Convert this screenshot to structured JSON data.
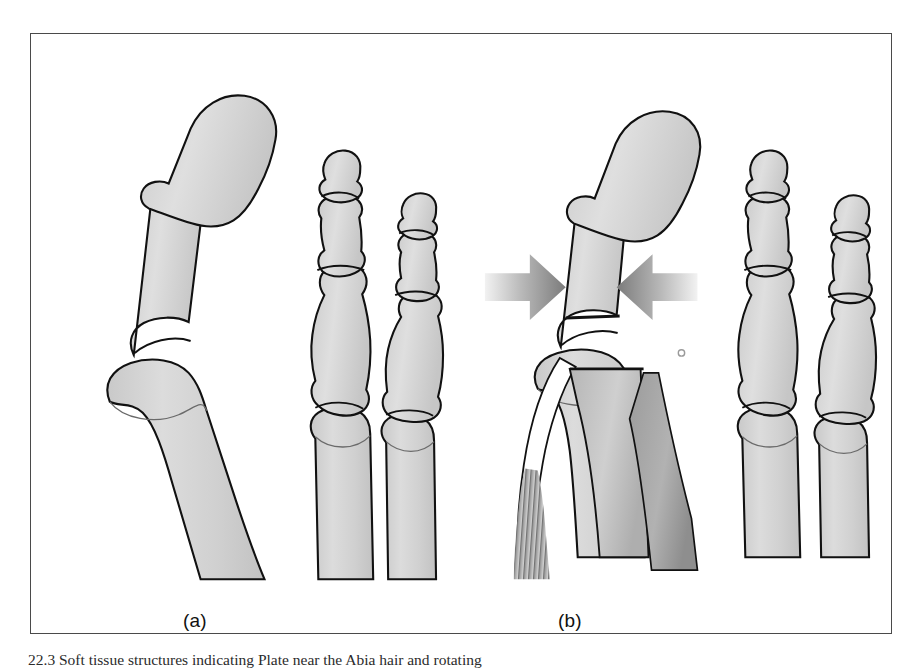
{
  "figure": {
    "caption": "22.3 Soft tissue structures indicating Plate  near the Abia hair and rotating",
    "frame_border_color": "#4a4a4a",
    "background_color": "#ffffff"
  },
  "panels": [
    {
      "id": "a",
      "label": "(a)",
      "description": "Normal alignment of the first, second and third toe phalanges with the first metatarsal head"
    },
    {
      "id": "b",
      "label": "(b)",
      "description": "Phalanges with opposing compression arrows at the proximal phalanx base and soft tissue, tendon and muscle structures at the first metatarsophalangeal joint"
    }
  ],
  "colors": {
    "bone_fill": "#d2d2d2",
    "bone_fill_light": "#dedede",
    "bone_outline": "#111111",
    "soft_tissue_dark": "#a8a8a8",
    "soft_tissue_mid": "#bdbdbd",
    "soft_tissue_light": "#e8e8e8",
    "muscle_stripe": "#777777",
    "arrow_dark": "#7d7d7d",
    "arrow_light": "#ededed",
    "frame": "#4a4a4a"
  },
  "annotations": {
    "arrow_left": {
      "name": "compression-arrow-left",
      "direction": "right",
      "meaning": "compressive force applied medially"
    },
    "arrow_right": {
      "name": "compression-arrow-right",
      "direction": "left",
      "meaning": "compressive force applied laterally"
    }
  },
  "anatomy": {
    "panel_a_bones": [
      "first distal phalanx",
      "first proximal phalanx",
      "first metatarsal",
      "second distal phalanx",
      "second middle phalanx",
      "second proximal phalanx",
      "second metatarsal",
      "third distal phalanx",
      "third middle phalanx",
      "third proximal phalanx",
      "third metatarsal"
    ],
    "panel_b_bones": [
      "first distal phalanx",
      "first proximal phalanx",
      "first metatarsal",
      "second distal phalanx",
      "second middle phalanx",
      "second proximal phalanx",
      "second metatarsal",
      "third distal phalanx",
      "third middle phalanx",
      "third proximal phalanx",
      "third metatarsal"
    ],
    "panel_b_soft_tissue": [
      "plantar fascia band",
      "flexor tendon",
      "intrinsic muscle belly with striations",
      "joint capsule"
    ]
  }
}
